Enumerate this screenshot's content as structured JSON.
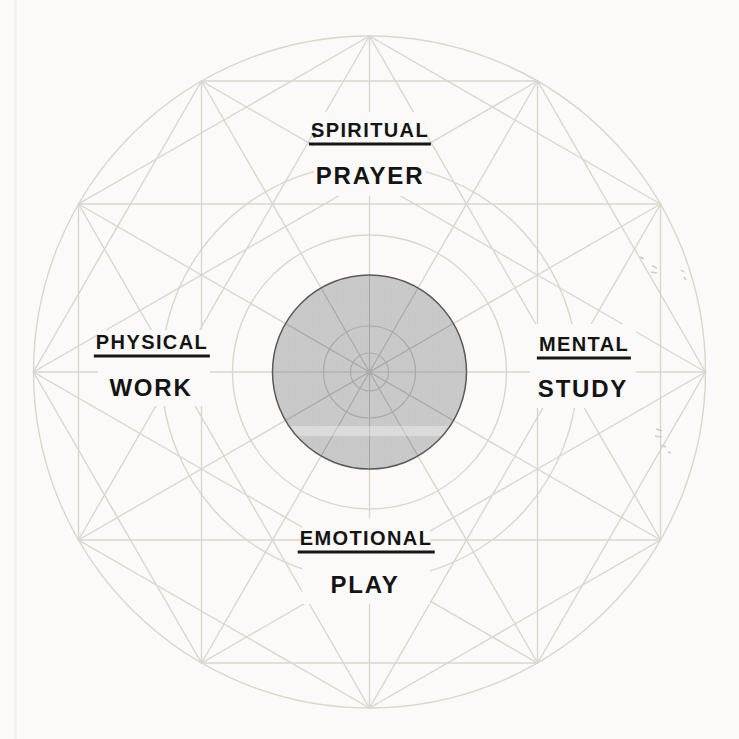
{
  "diagram": {
    "type": "life-balance-wheel",
    "quadrants": [
      {
        "position": "top",
        "category": "SPIRITUAL",
        "activity": "PRAYER"
      },
      {
        "position": "right",
        "category": "MENTAL",
        "activity": "STUDY"
      },
      {
        "position": "bottom",
        "category": "EMOTIONAL",
        "activity": "PLAY"
      },
      {
        "position": "left",
        "category": "PHYSICAL",
        "activity": "WORK"
      }
    ],
    "colors": {
      "background": "#fbfaf8",
      "construction_line": "#d9d6cf",
      "disc_fill": "#c7c7c7",
      "disc_outline": "#5a5a5a",
      "disc_inner_line": "#a9a9a9",
      "text": "#141414"
    }
  }
}
